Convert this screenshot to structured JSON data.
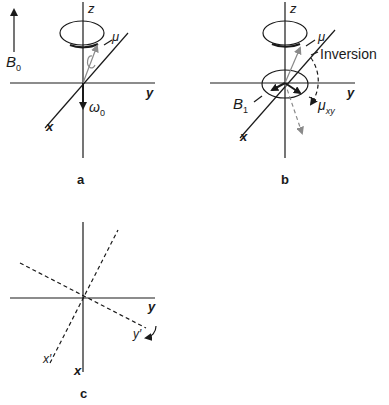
{
  "panels": {
    "a": {
      "caption": "a",
      "field_label": "B",
      "field_sub": "0",
      "axis_z": "z",
      "axis_y": "y",
      "axis_x": "x",
      "moment": "μ",
      "precession": "ω",
      "precession_sub": "0"
    },
    "b": {
      "caption": "b",
      "axis_z": "z",
      "axis_y": "y",
      "axis_x": "x",
      "moment": "μ",
      "inversion": "Inversion",
      "rf_field": "B",
      "rf_sub": "1",
      "transverse": "μ",
      "transverse_sub": "xy"
    },
    "c": {
      "caption": "c",
      "axis_y": "y",
      "axis_x": "x",
      "axis_y_rot": "y′",
      "axis_x_rot": "x′"
    }
  },
  "colors": {
    "ink": "#1a1a1a",
    "gray": "#8a8a8a"
  }
}
